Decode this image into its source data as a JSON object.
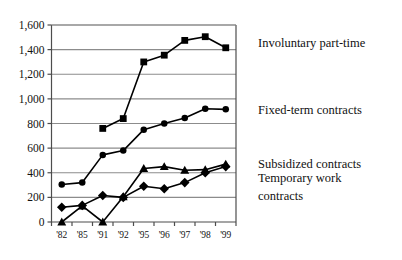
{
  "chart_data": {
    "type": "line",
    "title": "",
    "subtitle": "",
    "xlabel": "",
    "ylabel": "",
    "grid": true,
    "legend_position": "right",
    "ylim": [
      0,
      1600
    ],
    "yticks": [
      0,
      200,
      400,
      600,
      800,
      1000,
      1200,
      1400,
      1600
    ],
    "ytick_labels": [
      "0",
      "200",
      "400",
      "600",
      "800",
      "1,000",
      "1,200",
      "1,400",
      "1,600"
    ],
    "categories": [
      "'82",
      "'85",
      "'91",
      "'92",
      "'95",
      "'96",
      "'97",
      "'98",
      "'99"
    ],
    "series": [
      {
        "name": "Involuntary part-time",
        "marker": "square",
        "color": "#000000",
        "values": [
          null,
          null,
          760,
          840,
          1300,
          1355,
          1475,
          1505,
          1415
        ]
      },
      {
        "name": "Fixed-term contracts",
        "marker": "circle",
        "color": "#000000",
        "values": [
          305,
          320,
          545,
          580,
          750,
          800,
          845,
          920,
          915
        ]
      },
      {
        "name": "Subsidized contracts",
        "marker": "triangle",
        "color": "#000000",
        "values": [
          0,
          130,
          0,
          205,
          435,
          450,
          420,
          425,
          470
        ]
      },
      {
        "name": "Temporary work contracts",
        "marker": "diamond",
        "color": "#000000",
        "values": [
          120,
          135,
          215,
          200,
          290,
          270,
          320,
          400,
          450
        ]
      }
    ]
  },
  "legend": {
    "items": [
      {
        "label": "Involuntary part-time"
      },
      {
        "label": "Fixed-term contracts"
      },
      {
        "label": "Subsidized contracts"
      },
      {
        "label": "Temporary work"
      },
      {
        "label": "contracts"
      }
    ]
  },
  "axes": {
    "y_tick_labels": [
      "1,600",
      "1,400",
      "1,200",
      "1,000",
      "800",
      "600",
      "400",
      "200",
      "0"
    ],
    "x_tick_labels": [
      "'82",
      "'85",
      "'91",
      "'92",
      "'95",
      "'96",
      "'97",
      "'98",
      "'99"
    ]
  },
  "colors": {
    "ink": "#111111",
    "grid": "#8c8c8c",
    "axis": "#4d4d4d",
    "background": "#ffffff"
  }
}
